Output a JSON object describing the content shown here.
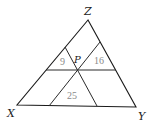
{
  "diagram": {
    "type": "triangle-subdivision",
    "vertices": {
      "Z": {
        "label": "Z",
        "x": 88,
        "y": 20
      },
      "X": {
        "label": "X",
        "x": 17,
        "y": 105
      },
      "Y": {
        "label": "Y",
        "x": 136,
        "y": 107
      }
    },
    "interior_point": {
      "label": "P",
      "x": 78,
      "y": 70
    },
    "small_triangle_areas": {
      "top_left": "9",
      "top_right": "16",
      "bottom": "25"
    },
    "colors": {
      "lines": "#1a1a1a",
      "area_labels": "#8a8a8a",
      "vertex_labels": "#222222"
    }
  }
}
